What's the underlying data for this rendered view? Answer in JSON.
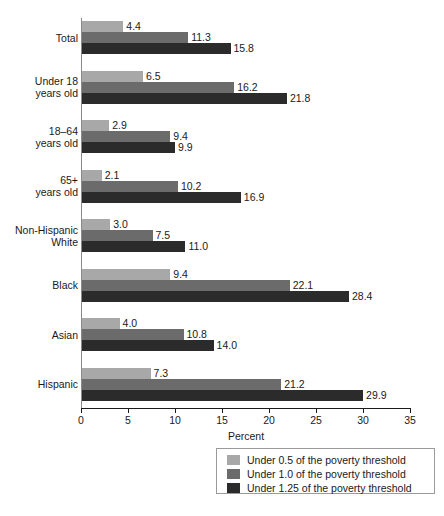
{
  "chart_data": {
    "type": "bar",
    "orientation": "horizontal",
    "title": "",
    "xlabel": "Percent",
    "ylabel": "",
    "xlim": [
      0,
      35
    ],
    "xticks": [
      0,
      5,
      10,
      15,
      20,
      25,
      30,
      35
    ],
    "grid": false,
    "legend_position": "bottom-right",
    "categories": [
      "Total",
      "Under 18\nyears old",
      "18–64\nyears old",
      "65+\nyears old",
      "Non-Hispanic\nWhite",
      "Black",
      "Asian",
      "Hispanic"
    ],
    "series": [
      {
        "name": "Under 0.5 of the poverty threshold",
        "color": "#a8a8a8",
        "values": [
          4.4,
          6.5,
          2.9,
          2.1,
          3.0,
          9.4,
          4.0,
          7.3
        ],
        "labels": [
          "4.4",
          "6.5",
          "2.9",
          "2.1",
          "3.0",
          "9.4",
          "4.0",
          "7.3"
        ]
      },
      {
        "name": "Under 1.0 of the poverty threshold",
        "color": "#6b6b6b",
        "values": [
          11.3,
          16.2,
          9.4,
          10.2,
          7.5,
          22.1,
          10.8,
          21.2
        ],
        "labels": [
          "11.3",
          "16.2",
          "9.4",
          "10.2",
          "7.5",
          "22.1",
          "10.8",
          "21.2"
        ]
      },
      {
        "name": "Under 1.25 of the poverty threshold",
        "color": "#2b2b2b",
        "values": [
          15.8,
          21.8,
          9.9,
          16.9,
          11.0,
          28.4,
          14.0,
          29.9
        ],
        "labels": [
          "15.8",
          "21.8",
          "9.9",
          "16.9",
          "11.0",
          "28.4",
          "14.0",
          "29.9"
        ]
      }
    ]
  },
  "axis": {
    "x_title": "Percent",
    "tick_labels": [
      "0",
      "5",
      "10",
      "15",
      "20",
      "25",
      "30",
      "35"
    ]
  },
  "legend": {
    "entries": [
      "Under 0.5 of the poverty threshold",
      "Under 1.0 of the poverty threshold",
      "Under 1.25 of the poverty threshold"
    ]
  },
  "colors": {
    "series_0": "#a8a8a8",
    "series_1": "#6b6b6b",
    "series_2": "#2b2b2b",
    "axis": "#1a1a1a",
    "background": "#ffffff"
  }
}
